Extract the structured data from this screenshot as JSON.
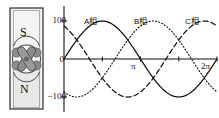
{
  "figure": {
    "kind": "three-phase-ac-generator-diagram",
    "magnet": {
      "north_label": "N",
      "south_label": "S",
      "rotor_name": "armature-coil-rotor",
      "body_color": "#ececec",
      "rotor_color": "#8a8a8a",
      "outline_color": "#3a3a3a"
    }
  },
  "chart_data": {
    "type": "line",
    "title": "",
    "xlabel": "",
    "ylabel": "",
    "xlim": [
      0,
      6.2832
    ],
    "ylim": [
      -140,
      140
    ],
    "grid": false,
    "legend_position": "inline-above-peaks",
    "x_ticks": [
      3.1416,
      6.2832
    ],
    "x_tick_labels": [
      "π",
      "2π"
    ],
    "y_ticks": [
      100,
      0,
      -100
    ],
    "y_tick_labels": [
      "100",
      "0",
      "−100"
    ],
    "amplitude": 100,
    "series": [
      {
        "name": "A相",
        "label": "A相",
        "style": "solid",
        "color": "#111111",
        "phase_deg": 0,
        "formula": "100·sin(x)"
      },
      {
        "name": "B相",
        "label": "B相",
        "style": "dotted",
        "color": "#111111",
        "phase_deg": -120,
        "formula": "100·sin(x − 2π/3)"
      },
      {
        "name": "C相",
        "label": "C相",
        "style": "dashed",
        "color": "#111111",
        "phase_deg": -240,
        "formula": "100·sin(x − 4π/3)"
      }
    ]
  },
  "labels": {
    "y_100": "100",
    "y_0": "0",
    "y_neg100": "−100",
    "x_pi": "π",
    "x_2pi": "2π",
    "phase_a": "A相",
    "phase_b": "B相",
    "phase_c": "C相",
    "pole_s": "S",
    "pole_n": "N"
  }
}
